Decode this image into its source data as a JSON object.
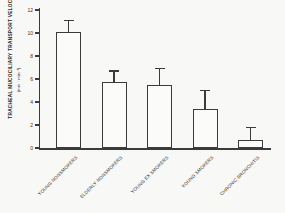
{
  "figure": {
    "paper_color": "#f8f8f6",
    "axis_color": "#3b3b3b",
    "ink_color": "#2f2f2f",
    "bar_fill": "#fbfbf9"
  },
  "chart_data": {
    "type": "bar",
    "title": "",
    "xlabel": "",
    "ylabel": "TRACHEAL MUCOCILIARY TRANSPORT VELOCITY",
    "ylabel_units": "(mm · min⁻¹)",
    "ylim": [
      0,
      12
    ],
    "yticks": [
      0,
      2,
      4,
      6,
      8,
      10,
      12
    ],
    "grid": false,
    "legend": "none",
    "error_bars": "upper only, capped",
    "bar_style": "open/unfilled with dark outline",
    "categories": [
      "YOUNG NONSMOKERS",
      "ELDERLY NONSMOKERS",
      "YOUNG EX SMOKERS",
      "YOUNG SMOKERS",
      "CHRONIC BRONCHITIS"
    ],
    "values": [
      10.1,
      5.7,
      5.5,
      3.4,
      0.7
    ],
    "error_plus": [
      1.0,
      1.0,
      1.4,
      1.6,
      1.1
    ]
  }
}
